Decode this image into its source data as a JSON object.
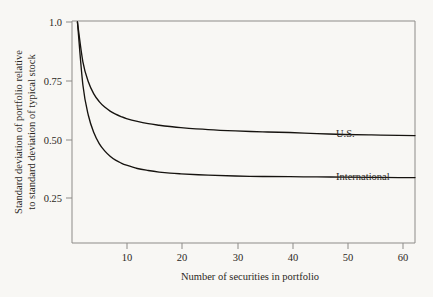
{
  "chart_data": {
    "type": "line",
    "title": "",
    "xlabel": "Number of securities in portfolio",
    "ylabel": "Standard deviation of portfolio relative to standard deviation of typical stock",
    "ylabel_line1": "Standard deviation of portfolio relative",
    "ylabel_line2": "to standard deviation of typical stock",
    "xlim": [
      0,
      63
    ],
    "ylim": [
      0,
      1.0
    ],
    "xticks": [
      10,
      20,
      30,
      40,
      50,
      60
    ],
    "xtick_labels": [
      "10",
      "20",
      "30",
      "40",
      "50",
      "60"
    ],
    "yticks": [
      0.25,
      0.5,
      0.75,
      1.0
    ],
    "ytick_labels": [
      "0.25",
      "0.50",
      "0.75",
      "1.0"
    ],
    "grid": false,
    "legend_position": "inline-right",
    "series": [
      {
        "name": "U.S.",
        "label": "U.S.",
        "color": "#16130f",
        "asymptote": 0.48,
        "x": [
          1,
          2,
          3,
          4,
          5,
          6,
          7,
          8,
          9,
          10,
          12,
          14,
          16,
          18,
          20,
          25,
          30,
          35,
          40,
          45,
          50,
          55,
          60,
          63
        ],
        "values": [
          1.0,
          0.82,
          0.73,
          0.675,
          0.64,
          0.615,
          0.597,
          0.583,
          0.572,
          0.563,
          0.55,
          0.54,
          0.533,
          0.527,
          0.522,
          0.513,
          0.507,
          0.503,
          0.5,
          0.495,
          0.491,
          0.489,
          0.487,
          0.486
        ]
      },
      {
        "name": "International",
        "label": "International",
        "color": "#16130f",
        "asymptote": 0.295,
        "x": [
          1,
          2,
          3,
          4,
          5,
          6,
          7,
          8,
          9,
          10,
          12,
          14,
          16,
          18,
          20,
          25,
          30,
          35,
          40,
          45,
          50,
          55,
          60,
          63
        ],
        "values": [
          1.0,
          0.715,
          0.578,
          0.5,
          0.45,
          0.417,
          0.393,
          0.375,
          0.362,
          0.352,
          0.337,
          0.328,
          0.321,
          0.316,
          0.313,
          0.307,
          0.303,
          0.301,
          0.3,
          0.299,
          0.298,
          0.297,
          0.296,
          0.296
        ]
      }
    ]
  },
  "labels": {
    "us_label": "U.S.",
    "international_label": "International"
  }
}
